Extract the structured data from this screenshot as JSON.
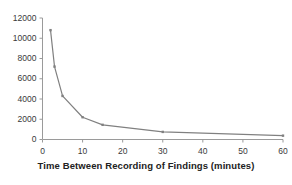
{
  "chart_data": {
    "type": "line",
    "title": "",
    "xlabel": "Time Between Recording of Findings (minutes)",
    "ylabel": "",
    "xlim": [
      0,
      60
    ],
    "ylim": [
      0,
      12000
    ],
    "xticks": [
      0,
      10,
      20,
      30,
      40,
      50,
      60
    ],
    "yticks": [
      0,
      2000,
      4000,
      6000,
      8000,
      10000,
      12000
    ],
    "xtick_labels": [
      "0",
      "10",
      "20",
      "30",
      "40",
      "50",
      "60"
    ],
    "ytick_labels": [
      "0",
      "2000",
      "4000",
      "6000",
      "8000",
      "10000",
      "12000"
    ],
    "grid": false,
    "legend": null,
    "series": [
      {
        "name": "findings",
        "marker": "small-square",
        "color": "#808080",
        "x": [
          2,
          3,
          5,
          10,
          15,
          30,
          60
        ],
        "y": [
          10800,
          7200,
          4300,
          2200,
          1450,
          750,
          380
        ]
      }
    ]
  },
  "axes": {
    "x_axis_title": "Time Between Recording of Findings (minutes)",
    "y_axis_title": ""
  },
  "style": {
    "line_color": "#808080",
    "axis_color": "#9a9a9a",
    "tick_text_color": "#3a3a3a",
    "title_color": "#222222",
    "background": "#ffffff"
  }
}
